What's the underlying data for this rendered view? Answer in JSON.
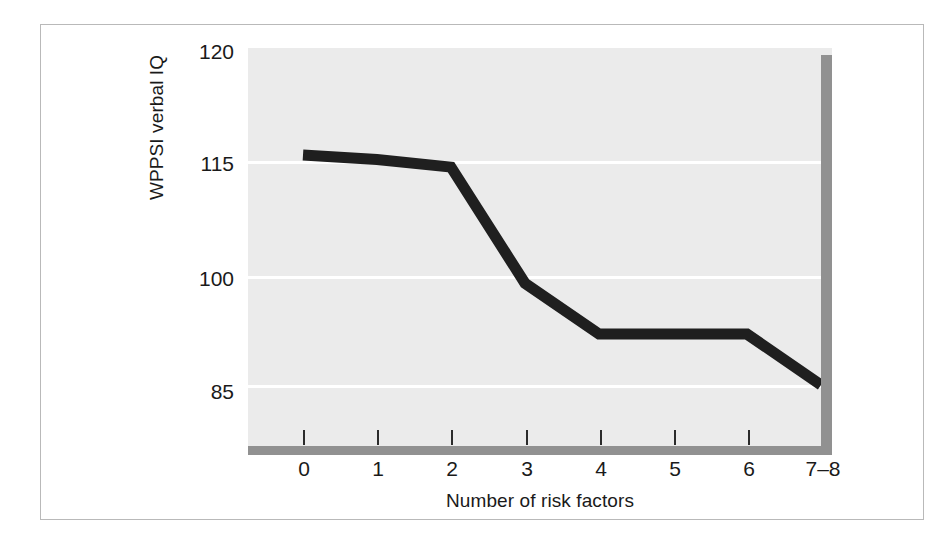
{
  "figure": {
    "background_color": "#ffffff",
    "frame_color": "#b9b9b9",
    "plot_background_color": "#ebebeb",
    "gridline_color": "#ffffff",
    "axis_bar_color": "#919191",
    "line_color": "#1f1f1f"
  },
  "chart_data": {
    "type": "line",
    "title": "",
    "xlabel": "Number of risk factors",
    "ylabel": "WPPSI verbal IQ",
    "categories": [
      "0",
      "1",
      "2",
      "3",
      "4",
      "5",
      "6",
      "7–8"
    ],
    "x_tick_labels": [
      "0",
      "1",
      "2",
      "3",
      "4",
      "5",
      "6",
      "7–8"
    ],
    "y_tick_labels": [
      "120",
      "115",
      "100",
      "85"
    ],
    "y_tick_values": [
      120,
      115,
      100,
      85
    ],
    "ylim": [
      82,
      120
    ],
    "grid": true,
    "grid_axis": "y",
    "legend": "none",
    "series": [
      {
        "name": "WPPSI verbal IQ",
        "values": [
          115.8,
          115.2,
          114.2,
          99.0,
          92.0,
          92.0,
          92.0,
          85.0
        ]
      }
    ]
  },
  "axes": {
    "y_title": "WPPSI verbal IQ",
    "x_title": "Number of risk factors",
    "y_ticks": [
      {
        "label": "120",
        "value": 120
      },
      {
        "label": "115",
        "value": 115
      },
      {
        "label": "100",
        "value": 100
      },
      {
        "label": "85",
        "value": 85
      }
    ],
    "x_ticks": [
      {
        "label": "0",
        "value": 0
      },
      {
        "label": "1",
        "value": 1
      },
      {
        "label": "2",
        "value": 2
      },
      {
        "label": "3",
        "value": 3
      },
      {
        "label": "4",
        "value": 4
      },
      {
        "label": "5",
        "value": 5
      },
      {
        "label": "6",
        "value": 6
      },
      {
        "label": "7–8",
        "value": 7
      }
    ]
  }
}
